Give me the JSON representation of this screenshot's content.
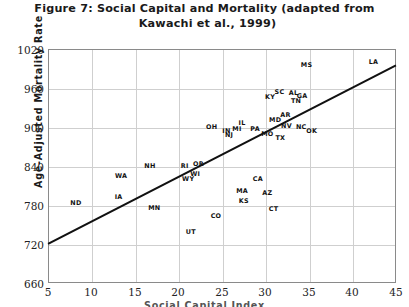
{
  "chart_data": {
    "type": "scatter",
    "title": "Figure 7: Social Capital and Mortality (adapted from Kawachi et al., 1999)",
    "title_lines": [
      "Figure 7: Social Capital and Mortality (adapted from",
      "Kawachi et al., 1999)"
    ],
    "xlabel": "Social Capital Index",
    "ylabel": "Age-Adjusted Mortality Rate",
    "xlim": [
      5,
      45
    ],
    "ylim": [
      660,
      1020
    ],
    "xticks": [
      5,
      10,
      15,
      20,
      25,
      30,
      35,
      40,
      45
    ],
    "yticks": [
      660,
      720,
      780,
      840,
      900,
      960,
      1020
    ],
    "grid": true,
    "legend": "none",
    "point_label_style": "state-abbreviation",
    "trendline": {
      "type": "linear",
      "x_start": 5,
      "y_start": 720,
      "x_end": 45,
      "y_end": 996,
      "color": "#111111"
    },
    "points": [
      {
        "label": "ND",
        "x": 8.1,
        "y": 784
      },
      {
        "label": "IA",
        "x": 13.0,
        "y": 794
      },
      {
        "label": "MN",
        "x": 17.1,
        "y": 777
      },
      {
        "label": "WA",
        "x": 13.3,
        "y": 827
      },
      {
        "label": "NH",
        "x": 16.6,
        "y": 842
      },
      {
        "label": "RI",
        "x": 20.6,
        "y": 842
      },
      {
        "label": "OR",
        "x": 22.2,
        "y": 845
      },
      {
        "label": "WI",
        "x": 21.8,
        "y": 829
      },
      {
        "label": "UT",
        "x": 21.3,
        "y": 740
      },
      {
        "label": "WY",
        "x": 21.0,
        "y": 822
      },
      {
        "label": "CO",
        "x": 24.2,
        "y": 765
      },
      {
        "label": "OH",
        "x": 23.7,
        "y": 901
      },
      {
        "label": "IN",
        "x": 25.4,
        "y": 896
      },
      {
        "label": "NJ",
        "x": 25.7,
        "y": 889
      },
      {
        "label": "MI",
        "x": 26.6,
        "y": 898
      },
      {
        "label": "IL",
        "x": 27.2,
        "y": 907
      },
      {
        "label": "PA",
        "x": 28.7,
        "y": 899
      },
      {
        "label": "MO",
        "x": 30.1,
        "y": 891
      },
      {
        "label": "TX",
        "x": 31.6,
        "y": 884
      },
      {
        "label": "CA",
        "x": 29.0,
        "y": 822
      },
      {
        "label": "MA",
        "x": 27.2,
        "y": 803
      },
      {
        "label": "KS",
        "x": 27.4,
        "y": 788
      },
      {
        "label": "AZ",
        "x": 30.1,
        "y": 800
      },
      {
        "label": "CT",
        "x": 30.8,
        "y": 776
      },
      {
        "label": "MD",
        "x": 31.0,
        "y": 913
      },
      {
        "label": "AR",
        "x": 32.2,
        "y": 920
      },
      {
        "label": "NV",
        "x": 32.3,
        "y": 903
      },
      {
        "label": "NC",
        "x": 34.0,
        "y": 902
      },
      {
        "label": "OK",
        "x": 35.2,
        "y": 896
      },
      {
        "label": "KY",
        "x": 30.4,
        "y": 948
      },
      {
        "label": "SC",
        "x": 31.5,
        "y": 955
      },
      {
        "label": "AL",
        "x": 33.1,
        "y": 954
      },
      {
        "label": "TN",
        "x": 33.4,
        "y": 941
      },
      {
        "label": "GA",
        "x": 34.1,
        "y": 949
      },
      {
        "label": "MS",
        "x": 34.6,
        "y": 997
      },
      {
        "label": "LA",
        "x": 42.3,
        "y": 1001
      }
    ]
  }
}
